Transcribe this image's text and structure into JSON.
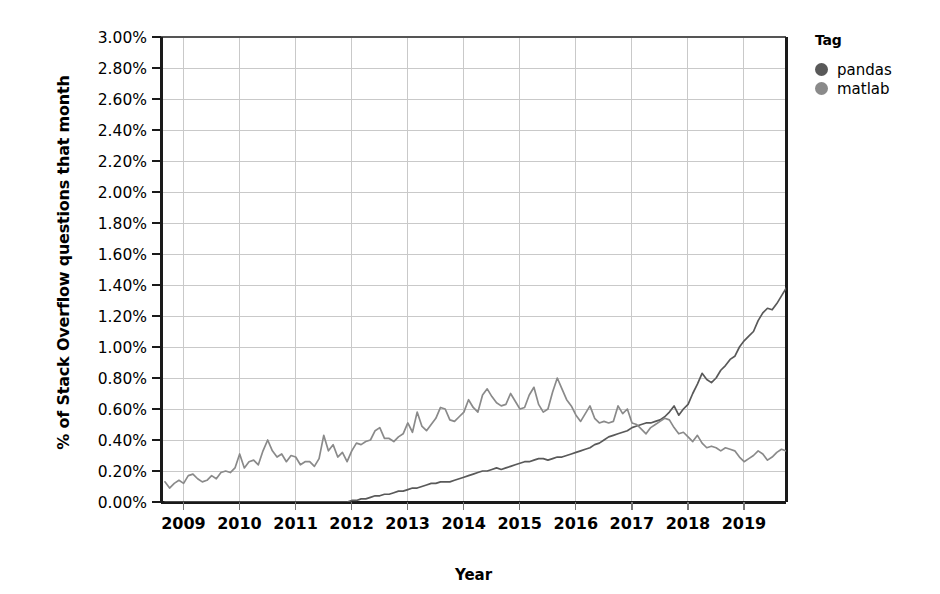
{
  "chart_data": {
    "type": "line",
    "title": "",
    "xlabel": "Year",
    "ylabel": "% of Stack Overflow questions that month",
    "legend_title": "Tag",
    "legend_position": "right",
    "grid": true,
    "xlim": [
      2008.6,
      2019.75
    ],
    "ylim": [
      0.0,
      3.0
    ],
    "ytick_labels": [
      "3.00%",
      "2.80%",
      "2.60%",
      "2.40%",
      "2.20%",
      "2.00%",
      "1.80%",
      "1.60%",
      "1.40%",
      "1.20%",
      "1.00%",
      "0.80%",
      "0.60%",
      "0.40%",
      "0.20%",
      "0.00%"
    ],
    "ytick_values": [
      3.0,
      2.8,
      2.6,
      2.4,
      2.2,
      2.0,
      1.8,
      1.6,
      1.4,
      1.2,
      1.0,
      0.8,
      0.6,
      0.4,
      0.2,
      0.0
    ],
    "xtick_labels": [
      "2009",
      "2010",
      "2011",
      "2012",
      "2013",
      "2014",
      "2015",
      "2016",
      "2017",
      "2018",
      "2019"
    ],
    "xtick_values": [
      2009,
      2010,
      2011,
      2012,
      2013,
      2014,
      2015,
      2016,
      2017,
      2018,
      2019
    ],
    "y_unit": "percent",
    "x_start": 2008.67,
    "x_step": 0.08333,
    "series": [
      {
        "name": "pandas",
        "color": "#595959",
        "values": [
          0.0,
          0.0,
          0.0,
          0.0,
          0.0,
          0.0,
          0.0,
          0.0,
          0.0,
          0.0,
          0.0,
          0.0,
          0.0,
          0.0,
          0.0,
          0.0,
          0.0,
          0.0,
          0.0,
          0.0,
          0.0,
          0.0,
          0.0,
          0.0,
          0.0,
          0.0,
          0.0,
          0.0,
          0.0,
          0.0,
          0.0,
          0.0,
          0.0,
          0.0,
          0.0,
          0.0,
          0.0,
          0.0,
          0.0,
          0.0,
          0.01,
          0.01,
          0.02,
          0.02,
          0.03,
          0.04,
          0.04,
          0.05,
          0.05,
          0.06,
          0.07,
          0.07,
          0.08,
          0.09,
          0.09,
          0.1,
          0.11,
          0.12,
          0.12,
          0.13,
          0.13,
          0.13,
          0.14,
          0.15,
          0.16,
          0.17,
          0.18,
          0.19,
          0.2,
          0.2,
          0.21,
          0.22,
          0.21,
          0.22,
          0.23,
          0.24,
          0.25,
          0.26,
          0.26,
          0.27,
          0.28,
          0.28,
          0.27,
          0.28,
          0.29,
          0.29,
          0.3,
          0.31,
          0.32,
          0.33,
          0.34,
          0.35,
          0.37,
          0.38,
          0.4,
          0.42,
          0.43,
          0.44,
          0.45,
          0.46,
          0.48,
          0.49,
          0.5,
          0.51,
          0.51,
          0.52,
          0.53,
          0.55,
          0.58,
          0.62,
          0.56,
          0.6,
          0.63,
          0.7,
          0.76,
          0.83,
          0.79,
          0.77,
          0.8,
          0.85,
          0.88,
          0.92,
          0.94,
          1.0,
          1.04,
          1.07,
          1.1,
          1.17,
          1.22,
          1.25,
          1.24,
          1.28,
          1.33,
          1.38,
          1.43,
          1.48,
          1.52,
          1.58,
          1.56,
          1.62,
          1.7,
          1.8,
          1.89,
          1.85,
          1.79,
          1.74,
          1.8,
          1.71,
          1.8,
          1.86,
          1.91,
          1.94,
          1.93,
          1.99,
          2.07,
          2.14,
          2.2,
          2.32,
          2.05
        ]
      },
      {
        "name": "matlab",
        "color": "#8a8a8a",
        "values": [
          0.13,
          0.09,
          0.12,
          0.14,
          0.12,
          0.17,
          0.18,
          0.15,
          0.13,
          0.14,
          0.17,
          0.15,
          0.19,
          0.2,
          0.19,
          0.22,
          0.31,
          0.22,
          0.26,
          0.27,
          0.24,
          0.33,
          0.4,
          0.33,
          0.29,
          0.31,
          0.26,
          0.3,
          0.29,
          0.24,
          0.26,
          0.26,
          0.23,
          0.28,
          0.43,
          0.33,
          0.37,
          0.29,
          0.32,
          0.26,
          0.33,
          0.38,
          0.37,
          0.39,
          0.4,
          0.46,
          0.48,
          0.41,
          0.41,
          0.39,
          0.42,
          0.44,
          0.51,
          0.45,
          0.58,
          0.49,
          0.46,
          0.5,
          0.54,
          0.61,
          0.6,
          0.53,
          0.52,
          0.55,
          0.58,
          0.66,
          0.61,
          0.58,
          0.69,
          0.73,
          0.68,
          0.64,
          0.62,
          0.63,
          0.7,
          0.65,
          0.6,
          0.61,
          0.69,
          0.74,
          0.63,
          0.58,
          0.6,
          0.71,
          0.8,
          0.73,
          0.66,
          0.62,
          0.56,
          0.52,
          0.57,
          0.62,
          0.54,
          0.51,
          0.52,
          0.51,
          0.52,
          0.62,
          0.57,
          0.6,
          0.51,
          0.5,
          0.47,
          0.44,
          0.48,
          0.5,
          0.52,
          0.54,
          0.53,
          0.48,
          0.44,
          0.45,
          0.42,
          0.39,
          0.43,
          0.38,
          0.35,
          0.36,
          0.35,
          0.33,
          0.35,
          0.34,
          0.33,
          0.29,
          0.26,
          0.28,
          0.3,
          0.33,
          0.31,
          0.27,
          0.29,
          0.32,
          0.34,
          0.33,
          0.3,
          0.28,
          0.26,
          0.25,
          0.24,
          0.23
        ]
      }
    ]
  },
  "legend": {
    "title": "Tag",
    "items": [
      {
        "label": "pandas",
        "color": "#595959"
      },
      {
        "label": "matlab",
        "color": "#8a8a8a"
      }
    ]
  },
  "axes": {
    "x_title": "Year",
    "y_title": "% of Stack Overflow questions that month"
  }
}
